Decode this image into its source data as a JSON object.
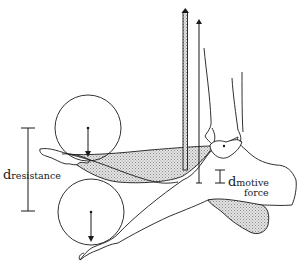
{
  "diagram": {
    "labels": {
      "resistance_main": "d",
      "resistance_sub": "resistance",
      "motive_main": "d",
      "motive_sub": "motive",
      "motive_sub2": "force"
    },
    "colors": {
      "ink": "#1a1a1a",
      "shading": "#bdbdbd",
      "background": "#ffffff"
    },
    "elements": [
      "upper-weight-circle",
      "lower-weight-circle",
      "upper-jaw-bone",
      "lower-jaw-bone",
      "shaded-muscle-upper",
      "shaded-muscle-lower",
      "motive-force-shaded-rod",
      "motive-force-arrow",
      "skull-joint",
      "resistance-dimension-bar",
      "motive-dimension-bar"
    ]
  }
}
